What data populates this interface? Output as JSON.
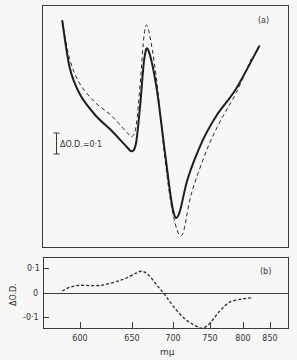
{
  "chart_data": [
    {
      "panel": "(a)",
      "type": "line",
      "title": "",
      "xlabel": "mμ",
      "ylabel": "",
      "scale_bar": {
        "label": "ΔO.D.=0·1",
        "value": 0.1
      },
      "x_ticks": [
        600,
        650,
        700,
        750,
        800,
        850
      ],
      "series": [
        {
          "name": "solid",
          "style": "solid",
          "x": [
            583,
            590,
            600,
            615,
            630,
            645,
            650,
            655,
            660,
            665,
            670,
            680,
            690,
            700,
            708,
            720,
            740,
            760,
            790,
            830
          ],
          "y_relative_od": [
            0.9,
            0.68,
            0.55,
            0.45,
            0.38,
            0.3,
            0.28,
            0.32,
            0.5,
            0.72,
            0.76,
            0.58,
            0.28,
            0.0,
            -0.02,
            0.15,
            0.33,
            0.45,
            0.58,
            0.78
          ]
        },
        {
          "name": "dashed",
          "style": "dashed",
          "x": [
            583,
            590,
            600,
            615,
            630,
            645,
            650,
            655,
            660,
            665,
            670,
            680,
            690,
            700,
            712,
            725,
            745,
            765,
            790,
            815
          ],
          "y_relative_od": [
            0.9,
            0.72,
            0.6,
            0.51,
            0.45,
            0.37,
            0.35,
            0.4,
            0.6,
            0.84,
            0.86,
            0.62,
            0.25,
            -0.02,
            -0.12,
            0.08,
            0.28,
            0.42,
            0.56,
            0.72
          ]
        }
      ]
    },
    {
      "panel": "(b)",
      "type": "line",
      "title": "",
      "xlabel": "mμ",
      "ylabel": "ΔO.D.",
      "x_ticks": [
        600,
        650,
        700,
        750,
        800,
        850
      ],
      "y_ticks": [
        0.1,
        0,
        -0.1
      ],
      "y_tick_labels": [
        "0·1",
        "0",
        "-0·1"
      ],
      "ylim": [
        -0.15,
        0.15
      ],
      "series": [
        {
          "name": "difference",
          "style": "dashed",
          "x": [
            583,
            590,
            600,
            620,
            640,
            655,
            662,
            670,
            680,
            690,
            700,
            715,
            730,
            740,
            750,
            765,
            780,
            800,
            815
          ],
          "y": [
            0.01,
            0.025,
            0.033,
            0.033,
            0.055,
            0.082,
            0.09,
            0.075,
            0.035,
            -0.005,
            -0.05,
            -0.1,
            -0.13,
            -0.14,
            -0.12,
            -0.07,
            -0.035,
            -0.022,
            -0.018
          ]
        }
      ]
    }
  ],
  "labels": {
    "panel_a": "(a)",
    "panel_b": "(b)",
    "scale_bar": "ΔO.D.=0·1",
    "ylabel_b": "ΔO.D.",
    "xlabel": "mμ",
    "ytick_pos": "0·1",
    "ytick_zero": "0",
    "ytick_neg": "-0·1",
    "xticks": [
      "600",
      "650",
      "700",
      "750",
      "800",
      "850"
    ]
  }
}
